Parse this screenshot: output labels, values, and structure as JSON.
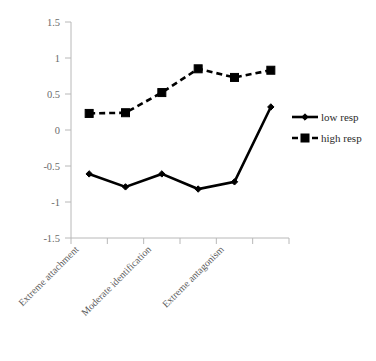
{
  "chart_data": {
    "type": "line",
    "title": "",
    "xlabel": "",
    "ylabel": "",
    "categories": [
      "Extreme attachment",
      "",
      "Moderate identification",
      "",
      "Extreme antagonism",
      ""
    ],
    "axis_category_labels": [
      "Extreme attachment",
      "Moderate identification",
      "Extreme antagonism"
    ],
    "x": [
      1,
      2,
      3,
      4,
      5,
      6
    ],
    "ylim": [
      -1.5,
      1.5
    ],
    "xlim": [
      0.5,
      6.5
    ],
    "ytick_labels": [
      "1.5",
      "1",
      "0.5",
      "0",
      "-0.5",
      "-1",
      "-1.5"
    ],
    "ytick_values": [
      1.5,
      1,
      0.5,
      0,
      -0.5,
      -1,
      -1.5
    ],
    "grid": false,
    "legend_position": "right",
    "series": [
      {
        "name": "low resp",
        "label": "low resp",
        "marker": "diamond",
        "line_style": "solid",
        "color": "#000000",
        "values": [
          -0.61,
          -0.79,
          -0.61,
          -0.82,
          -0.72,
          0.32
        ]
      },
      {
        "name": "high resp",
        "label": "high resp",
        "marker": "square",
        "line_style": "dashed",
        "color": "#000000",
        "values": [
          0.23,
          0.24,
          0.52,
          0.85,
          0.73,
          0.83
        ]
      }
    ]
  },
  "legend": {
    "entries": [
      {
        "label": "low resp",
        "marker": "diamond",
        "style": "solid"
      },
      {
        "label": "high resp",
        "marker": "square",
        "style": "dashed"
      }
    ]
  },
  "axes": {
    "y_ticks": [
      "1.5",
      "1",
      "0.5",
      "0",
      "-0.5",
      "-1",
      "-1.5"
    ],
    "x_categories": [
      "Extreme attachment",
      "Moderate identification",
      "Extreme antagonism"
    ]
  },
  "colors": {
    "series": "#000000",
    "axis": "#b8b8b8",
    "tick_text": "#6b6b6b",
    "category_text": "#5a5a5a",
    "legend_text": "#2b2b2b",
    "background": "#ffffff"
  }
}
